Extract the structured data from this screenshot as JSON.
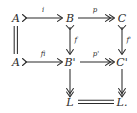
{
  "diagram": {
    "type": "commutative-diagram",
    "background_color": "#ffffff",
    "ink_color": "#2b2b2b",
    "nodes": [
      {
        "id": "A1",
        "label": "A",
        "x": 16,
        "y": 18
      },
      {
        "id": "B1",
        "label": "B",
        "x": 70,
        "y": 18
      },
      {
        "id": "C1",
        "label": "C",
        "x": 122,
        "y": 18
      },
      {
        "id": "A2",
        "label": "A",
        "x": 16,
        "y": 62
      },
      {
        "id": "B2",
        "label": "B'",
        "x": 70,
        "y": 62
      },
      {
        "id": "C2",
        "label": "C'",
        "x": 122,
        "y": 62
      },
      {
        "id": "L1",
        "label": "L",
        "x": 70,
        "y": 105
      },
      {
        "id": "L2",
        "label": "L.",
        "x": 122,
        "y": 105
      }
    ],
    "edges": [
      {
        "id": "e-A1-B1",
        "from": "A1",
        "to": "B1",
        "label": "i",
        "style": "mono",
        "direction": "right"
      },
      {
        "id": "e-B1-C1",
        "from": "B1",
        "to": "C1",
        "label": "p",
        "style": "epi",
        "direction": "right"
      },
      {
        "id": "e-A1-A2",
        "from": "A1",
        "to": "A2",
        "label": "",
        "style": "equals",
        "direction": "down"
      },
      {
        "id": "e-B1-B2",
        "from": "B1",
        "to": "B2",
        "label": "f",
        "style": "epi",
        "direction": "down"
      },
      {
        "id": "e-C1-C2",
        "from": "C1",
        "to": "C2",
        "label": "f'",
        "style": "epi",
        "direction": "down"
      },
      {
        "id": "e-A2-B2",
        "from": "A2",
        "to": "B2",
        "label": "fi",
        "style": "mono",
        "direction": "right"
      },
      {
        "id": "e-B2-C2",
        "from": "B2",
        "to": "C2",
        "label": "p'",
        "style": "epi",
        "direction": "right"
      },
      {
        "id": "e-B2-L1",
        "from": "B2",
        "to": "L1",
        "label": "",
        "style": "epi",
        "direction": "down"
      },
      {
        "id": "e-C2-L2",
        "from": "C2",
        "to": "L2",
        "label": "",
        "style": "epi",
        "direction": "down"
      },
      {
        "id": "e-L1-L2",
        "from": "L1",
        "to": "L2",
        "label": "",
        "style": "equals",
        "direction": "right"
      }
    ]
  }
}
